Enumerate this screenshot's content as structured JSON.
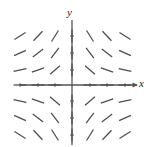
{
  "figure": {
    "kind": "slope-field",
    "background_color": "#ffffff",
    "stroke_color": "#4d4d4d",
    "axis_color": "#555555"
  },
  "axes": {
    "x_label": "x",
    "y_label": "y",
    "x_axis": {
      "y_px": 85,
      "x_start_px": 20,
      "x_end_px": 137,
      "arrow": true
    },
    "y_axis": {
      "x_px": 72,
      "y_start_px": 20,
      "y_end_px": 145,
      "arrow": false
    },
    "x_ticks_px": [
      20,
      38,
      55,
      90,
      107,
      125
    ],
    "y_ticks_px": [
      36,
      53,
      70,
      101,
      118,
      135
    ]
  },
  "chart_data": {
    "type": "scatter",
    "title": "",
    "xlabel": "x",
    "ylabel": "y",
    "xlim": [
      -3.5,
      3.5
    ],
    "ylim": [
      -3.5,
      3.5
    ],
    "grid": false,
    "legend_position": "none",
    "equation": "dy/dx = -x*y",
    "x": [
      -3,
      -2,
      -1,
      0,
      1,
      2,
      3
    ],
    "y": [
      3,
      2,
      1,
      0,
      -1,
      -2,
      -3
    ],
    "segment_length": 13,
    "segments": [
      {
        "x": -3,
        "y": 3,
        "slope": 0.62,
        "px": 20,
        "py": 36
      },
      {
        "x": -2,
        "y": 3,
        "slope": 1.05,
        "px": 38,
        "py": 36
      },
      {
        "x": -1,
        "y": 3,
        "slope": 1.6,
        "px": 55,
        "py": 36
      },
      {
        "x": 0,
        "y": 3,
        "slope": 6.0,
        "px": 72,
        "py": 36
      },
      {
        "x": 1,
        "y": 3,
        "slope": -1.6,
        "px": 90,
        "py": 36
      },
      {
        "x": 2,
        "y": 3,
        "slope": -1.05,
        "px": 107,
        "py": 36
      },
      {
        "x": 3,
        "y": 3,
        "slope": -0.62,
        "px": 125,
        "py": 36
      },
      {
        "x": -3,
        "y": 2,
        "slope": 0.45,
        "px": 20,
        "py": 53
      },
      {
        "x": -2,
        "y": 2,
        "slope": 0.75,
        "px": 38,
        "py": 53
      },
      {
        "x": -1,
        "y": 2,
        "slope": 1.35,
        "px": 55,
        "py": 53
      },
      {
        "x": 0,
        "y": 2,
        "slope": 6.0,
        "px": 72,
        "py": 53
      },
      {
        "x": 1,
        "y": 2,
        "slope": -1.35,
        "px": 90,
        "py": 53
      },
      {
        "x": 2,
        "y": 2,
        "slope": -0.75,
        "px": 107,
        "py": 53
      },
      {
        "x": 3,
        "y": 2,
        "slope": -0.45,
        "px": 125,
        "py": 53
      },
      {
        "x": -3,
        "y": 1,
        "slope": 0.2,
        "px": 20,
        "py": 70
      },
      {
        "x": -2,
        "y": 1,
        "slope": 0.34,
        "px": 38,
        "py": 70
      },
      {
        "x": -1,
        "y": 1,
        "slope": 0.85,
        "px": 55,
        "py": 70
      },
      {
        "x": 0,
        "y": 1,
        "slope": 6.0,
        "px": 72,
        "py": 70
      },
      {
        "x": 1,
        "y": 1,
        "slope": -0.85,
        "px": 90,
        "py": 70
      },
      {
        "x": 2,
        "y": 1,
        "slope": -0.34,
        "px": 107,
        "py": 70
      },
      {
        "x": 3,
        "y": 1,
        "slope": -0.2,
        "px": 125,
        "py": 70
      },
      {
        "x": -3,
        "y": 0,
        "slope": 0,
        "px": 20,
        "py": 85
      },
      {
        "x": -2,
        "y": 0,
        "slope": 0,
        "px": 38,
        "py": 85
      },
      {
        "x": -1,
        "y": 0,
        "slope": 0,
        "px": 55,
        "py": 85
      },
      {
        "x": 1,
        "y": 0,
        "slope": 0,
        "px": 90,
        "py": 85
      },
      {
        "x": 2,
        "y": 0,
        "slope": 0,
        "px": 107,
        "py": 85
      },
      {
        "x": 3,
        "y": 0,
        "slope": 0,
        "px": 125,
        "py": 85
      },
      {
        "x": -3,
        "y": -1,
        "slope": -0.2,
        "px": 20,
        "py": 101
      },
      {
        "x": -2,
        "y": -1,
        "slope": -0.34,
        "px": 38,
        "py": 101
      },
      {
        "x": -1,
        "y": -1,
        "slope": -0.85,
        "px": 55,
        "py": 101
      },
      {
        "x": 0,
        "y": -1,
        "slope": 6.0,
        "px": 72,
        "py": 101
      },
      {
        "x": 1,
        "y": -1,
        "slope": 0.85,
        "px": 90,
        "py": 101
      },
      {
        "x": 2,
        "y": -1,
        "slope": 0.34,
        "px": 107,
        "py": 101
      },
      {
        "x": 3,
        "y": -1,
        "slope": 0.2,
        "px": 125,
        "py": 101
      },
      {
        "x": -3,
        "y": -2,
        "slope": -0.45,
        "px": 20,
        "py": 118
      },
      {
        "x": -2,
        "y": -2,
        "slope": -0.75,
        "px": 38,
        "py": 118
      },
      {
        "x": -1,
        "y": -2,
        "slope": -1.35,
        "px": 55,
        "py": 118
      },
      {
        "x": 0,
        "y": -2,
        "slope": 6.0,
        "px": 72,
        "py": 118
      },
      {
        "x": 1,
        "y": -2,
        "slope": 1.35,
        "px": 90,
        "py": 118
      },
      {
        "x": 2,
        "y": -2,
        "slope": 0.75,
        "px": 107,
        "py": 118
      },
      {
        "x": 3,
        "y": -2,
        "slope": 0.45,
        "px": 125,
        "py": 118
      },
      {
        "x": -3,
        "y": -3,
        "slope": -0.62,
        "px": 20,
        "py": 135
      },
      {
        "x": -2,
        "y": -3,
        "slope": -1.05,
        "px": 38,
        "py": 135
      },
      {
        "x": -1,
        "y": -3,
        "slope": -1.6,
        "px": 55,
        "py": 135
      },
      {
        "x": 0,
        "y": -3,
        "slope": 6.0,
        "px": 72,
        "py": 135
      },
      {
        "x": 1,
        "y": -3,
        "slope": 1.6,
        "px": 90,
        "py": 135
      },
      {
        "x": 2,
        "y": -3,
        "slope": 1.05,
        "px": 107,
        "py": 135
      },
      {
        "x": 3,
        "y": -3,
        "slope": 0.62,
        "px": 125,
        "py": 135
      }
    ]
  }
}
